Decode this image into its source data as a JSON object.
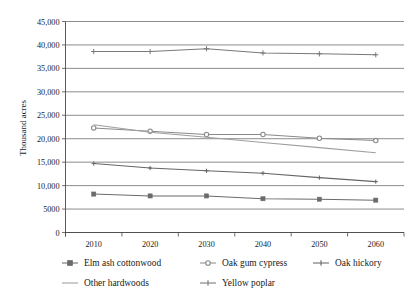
{
  "chart_data": {
    "type": "line",
    "title": "",
    "xlabel": "",
    "ylabel": "Thousand acres",
    "categories": [
      "2010",
      "2020",
      "2030",
      "2040",
      "2050",
      "2060"
    ],
    "x_tick_labels": [
      "2010",
      "2020",
      "2030",
      "2040",
      "2050",
      "2060"
    ],
    "y_tick_labels": [
      "0",
      "5000",
      "10,000",
      "15,000",
      "20,000",
      "25,000",
      "30,000",
      "35,000",
      "40,000",
      "45,000"
    ],
    "y_tick_values": [
      0,
      5000,
      10000,
      15000,
      20000,
      25000,
      30000,
      35000,
      40000,
      45000
    ],
    "ylim": [
      0,
      45000
    ],
    "grid": true,
    "legend_position": "bottom",
    "series": [
      {
        "name": "Elm ash cottonwood",
        "marker": "square",
        "color": "#6b6b6b",
        "values": [
          8200,
          7800,
          7800,
          7200,
          7100,
          6900
        ]
      },
      {
        "name": "Oak gum cypress",
        "marker": "circle",
        "color": "#8a8a8a",
        "values": [
          22300,
          21600,
          20900,
          20900,
          20100,
          19600
        ]
      },
      {
        "name": "Oak hickory",
        "marker": "plus-small",
        "color": "#666666",
        "values": [
          14700,
          13750,
          13150,
          12650,
          11700,
          10850
        ]
      },
      {
        "name": "Other hardwoods",
        "marker": "none",
        "color": "#9e9e9e",
        "values": [
          23000,
          21400,
          20300,
          19200,
          18100,
          17000
        ]
      },
      {
        "name": "Yellow poplar",
        "marker": "plus",
        "color": "#787878",
        "values": [
          38600,
          38600,
          39200,
          38300,
          38100,
          37900
        ]
      }
    ]
  },
  "legend": {
    "entries": [
      {
        "label": "Elm ash cottonwood",
        "marker": "square-marker-icon"
      },
      {
        "label": "Oak gum cypress",
        "marker": "circle-marker-icon"
      },
      {
        "label": "Oak hickory",
        "marker": "line-marker-icon"
      },
      {
        "label": "Other hardwoods",
        "marker": "line-marker-icon"
      },
      {
        "label": "Yellow poplar",
        "marker": "plus-marker-icon"
      }
    ]
  }
}
